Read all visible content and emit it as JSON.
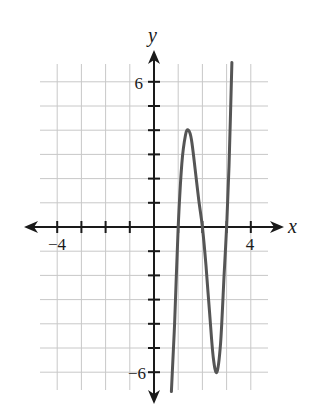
{
  "chart_data": {
    "type": "line",
    "title": "",
    "xlabel": "x",
    "ylabel": "y",
    "xlim": [
      -4.7,
      4.7
    ],
    "ylim": [
      -6.7,
      6.7
    ],
    "grid": true,
    "x_tick_labels": [
      {
        "value": -4,
        "label": "−4"
      },
      {
        "value": 4,
        "label": "4"
      }
    ],
    "y_tick_labels": [
      {
        "value": 6,
        "label": "6"
      },
      {
        "value": -6,
        "label": "−6"
      }
    ],
    "x_ticks": [
      -4,
      -3,
      -2,
      -1,
      1,
      2,
      3,
      4
    ],
    "y_ticks": [
      -6,
      -5,
      -4,
      -3,
      -2,
      -1,
      1,
      2,
      3,
      4,
      5,
      6
    ],
    "series": [
      {
        "name": "f(x)",
        "description": "cubic with zeros at x = 1, 2, 3; local max near (1.4, 4); local min near (2.6, -6)",
        "x": [
          0.72,
          0.85,
          1.0,
          1.15,
          1.3,
          1.42,
          1.55,
          1.7,
          1.85,
          2.0,
          2.15,
          2.3,
          2.45,
          2.6,
          2.75,
          2.9,
          3.0,
          3.1,
          3.22
        ],
        "y": [
          -6.8,
          -4.0,
          0.0,
          2.6,
          3.8,
          4.0,
          3.6,
          2.4,
          1.1,
          0.0,
          -1.6,
          -3.6,
          -5.4,
          -6.0,
          -4.8,
          -1.9,
          0.0,
          2.5,
          6.8
        ]
      }
    ],
    "colors": {
      "curve": "#555555",
      "axis": "#1a1a1a",
      "grid": "#c8c8c8"
    }
  }
}
